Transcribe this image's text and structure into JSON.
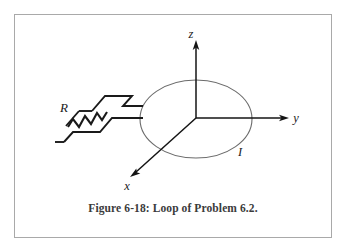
{
  "figure": {
    "caption": "Figure 6-18: Loop of Problem 6.2.",
    "border_color": "#a9a9a9",
    "background_color": "#ffffff"
  },
  "axes": {
    "origin": {
      "x": 196,
      "y": 118
    },
    "z": {
      "label": "z",
      "tip": {
        "x": 196,
        "y": 43
      },
      "color": "#141414"
    },
    "y": {
      "label": "y",
      "tip": {
        "x": 288,
        "y": 118
      },
      "color": "#141414"
    },
    "x": {
      "label": "x",
      "tip": {
        "x": 131,
        "y": 176
      },
      "color": "#141414"
    }
  },
  "loop": {
    "shape": "ellipse",
    "center": {
      "x": 196,
      "y": 119
    },
    "radius_x": 56,
    "radius_y": 39,
    "stroke_color": "#6b6b6b",
    "current_label": "I"
  },
  "resistor": {
    "label": "R",
    "stroke_color": "#1a1a1a",
    "zigzag_peaks": 4
  },
  "leads": {
    "stroke_color": "#1a1a1a",
    "description": "two parallel leads from loop to resistor"
  }
}
